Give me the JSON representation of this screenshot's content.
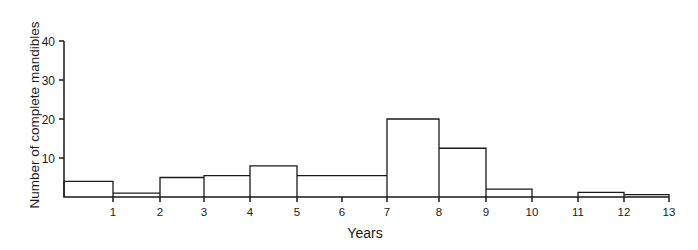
{
  "chart_data": {
    "type": "bar",
    "subtype": "histogram-step",
    "title": "",
    "xlabel": "Years",
    "ylabel": "Number of complete mandibles",
    "xlim": [
      0,
      13
    ],
    "ylim": [
      0,
      40
    ],
    "x_ticks": [
      1,
      2,
      3,
      4,
      5,
      6,
      7,
      8,
      9,
      10,
      11,
      12,
      13
    ],
    "y_ticks": [
      10,
      20,
      30,
      40
    ],
    "grid": false,
    "legend": null,
    "bins": [
      {
        "start": 0,
        "end": 1,
        "value": 4
      },
      {
        "start": 1,
        "end": 2,
        "value": 1
      },
      {
        "start": 2,
        "end": 3,
        "value": 5
      },
      {
        "start": 3,
        "end": 4,
        "value": 5.5
      },
      {
        "start": 4,
        "end": 5,
        "value": 8
      },
      {
        "start": 5,
        "end": 7,
        "value": 5.5
      },
      {
        "start": 7,
        "end": 8,
        "value": 20
      },
      {
        "start": 8,
        "end": 9,
        "value": 12.5
      },
      {
        "start": 9,
        "end": 10,
        "value": 2
      },
      {
        "start": 10,
        "end": 11,
        "value": 0
      },
      {
        "start": 11,
        "end": 12,
        "value": 1.2
      },
      {
        "start": 12,
        "end": 13,
        "value": 0.6
      }
    ],
    "categories": [
      "0-1",
      "1-2",
      "2-3",
      "3-4",
      "4-5",
      "5-7",
      "7-8",
      "8-9",
      "9-10",
      "10-11",
      "11-12",
      "12-13"
    ],
    "values": [
      4,
      1,
      5,
      5.5,
      8,
      5.5,
      20,
      12.5,
      2,
      0,
      1.2,
      0.6
    ]
  },
  "layout": {
    "x_pixels": [
      64,
      113,
      160,
      204,
      250,
      297,
      342,
      387,
      439,
      486,
      532,
      578,
      624,
      669
    ],
    "y_zero_px": 197,
    "y_top_px": 41,
    "y_max": 40,
    "line_color": "#1a1a1a"
  }
}
